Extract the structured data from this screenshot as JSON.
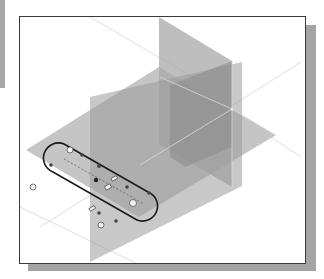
{
  "viewport": {
    "background": "#ffffff",
    "frame_color": "#3a3a3a",
    "shadow_color": "#a4a4a4",
    "datum_planes": [
      {
        "name": "horizontal-plane",
        "color": "#bdbdbd"
      },
      {
        "name": "front-vertical-plane",
        "color": "#a9a9a9"
      },
      {
        "name": "right-vertical-plane",
        "color": "#b0b0b0"
      }
    ],
    "sketch": {
      "profile": "slot",
      "line_color": "#1a1a1a",
      "constraint_icons": [
        "tangent-icon",
        "parallel-icon",
        "equal-icon",
        "coincident-icon",
        "center-point-icon"
      ]
    }
  }
}
